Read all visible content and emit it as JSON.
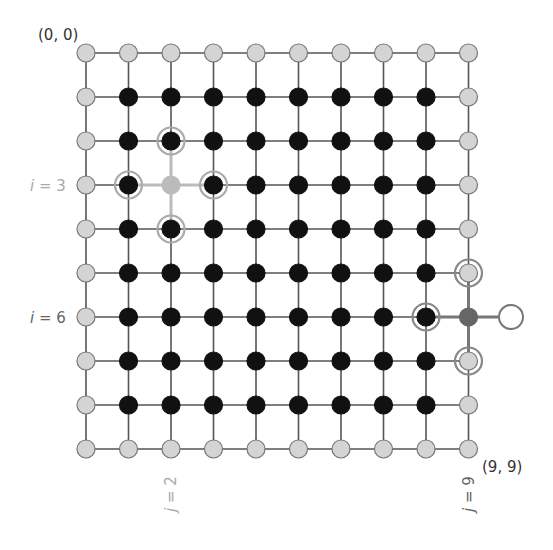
{
  "diagram": {
    "grid": {
      "rows": 10,
      "cols": 10,
      "x0": 86,
      "dx": 42.5,
      "y0": 53,
      "dy": 44,
      "node_radius": 9
    },
    "corner_labels": {
      "top_left": "(0, 0)",
      "bottom_right": "(9, 9)"
    },
    "row_labels": [
      {
        "text": "i = 3",
        "row": 3,
        "color": "#aaaaaa"
      },
      {
        "text": "i = 6",
        "row": 6,
        "color": "#666666"
      }
    ],
    "col_labels": [
      {
        "text": "j = 2",
        "col": 2,
        "color": "#aaaaaa"
      },
      {
        "text": "j = 9",
        "col": 9,
        "color": "#666666"
      }
    ],
    "colors": {
      "line": "#555555",
      "boundary_fill": "#d4d4d4",
      "boundary_stroke": "#777777",
      "interior_fill": "#111111",
      "highlight_light_line": "#bbbbbb",
      "highlight_light_ring": "#aaaaaa",
      "highlight_light_center": "#bbbbbb",
      "highlight_dark_line": "#777777",
      "highlight_dark_ring": "#888888",
      "highlight_dark_center": "#666666",
      "ghost_fill": "#ffffff",
      "ghost_stroke": "#777777"
    },
    "highlights": [
      {
        "name": "stencil-i3-j2",
        "center": [
          3,
          2
        ],
        "neighbors": [
          [
            2,
            2
          ],
          [
            4,
            2
          ],
          [
            3,
            1
          ],
          [
            3,
            3
          ]
        ],
        "style": "light"
      },
      {
        "name": "stencil-i6-j9",
        "center": [
          6,
          9
        ],
        "neighbors": [
          [
            5,
            9
          ],
          [
            7,
            9
          ],
          [
            6,
            8
          ]
        ],
        "ghost": [
          6,
          10
        ],
        "style": "dark"
      }
    ]
  }
}
